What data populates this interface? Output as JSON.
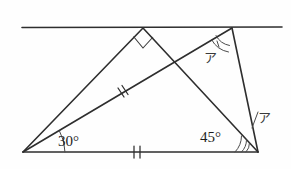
{
  "figure": {
    "kind": "geometry-diagram",
    "background_color": "#fefefe",
    "stroke_color": "#2e2e2e"
  },
  "labels": {
    "angle_left": "30°",
    "angle_bottom_right": "45°",
    "mark_upper": "ア",
    "mark_lower": "ア"
  },
  "points": {
    "line_left": {
      "x": 22,
      "y": 27
    },
    "line_right": {
      "x": 282,
      "y": 27
    },
    "apex_top": {
      "x": 143,
      "y": 28
    },
    "vertex_top_right": {
      "x": 232,
      "y": 28
    },
    "vertex_bottom_left": {
      "x": 23,
      "y": 152
    },
    "vertex_bottom_right": {
      "x": 258,
      "y": 152
    },
    "crossing": {
      "x": 172,
      "y": 68
    }
  },
  "segments": [
    {
      "name": "top-parallel-line",
      "from": "line_left",
      "to": "line_right"
    },
    {
      "name": "left-upper-side",
      "from": "vertex_bottom_left",
      "to": "apex_top"
    },
    {
      "name": "apex-to-bottom-right",
      "from": "apex_top",
      "to": "vertex_bottom_right"
    },
    {
      "name": "bottom-base",
      "from": "vertex_bottom_left",
      "to": "vertex_bottom_right"
    },
    {
      "name": "diagonal-median",
      "from": "vertex_bottom_left",
      "to": "vertex_top_right"
    },
    {
      "name": "right-side",
      "from": "vertex_top_right",
      "to": "vertex_bottom_right"
    }
  ],
  "tick_marks": [
    {
      "name": "tick-on-diagonal",
      "count": 2,
      "x": 122,
      "y": 92
    },
    {
      "name": "tick-on-base",
      "count": 2,
      "x": 137,
      "y": 152
    }
  ],
  "angle_marks": [
    {
      "name": "right-angle-at-apex",
      "type": "square",
      "at": "apex_top"
    },
    {
      "name": "arc-at-bottom-left",
      "type": "single-arc",
      "at": "vertex_bottom_left",
      "label": "30°"
    },
    {
      "name": "arc-at-top-right",
      "type": "double-arc",
      "at": "vertex_top_right",
      "label": "ア"
    },
    {
      "name": "arc-45-at-bottom-right",
      "type": "single-arc",
      "at": "vertex_bottom_right",
      "label": "45°"
    },
    {
      "name": "arc-a-at-bottom-right",
      "type": "double-arc",
      "at": "vertex_bottom_right",
      "label": "ア"
    }
  ]
}
